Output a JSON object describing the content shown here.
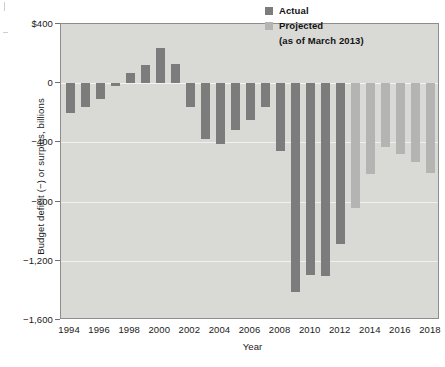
{
  "chart_data": {
    "type": "bar",
    "title": "",
    "subtitle": "",
    "xlabel": "Year",
    "ylabel": "Budget deficit (−) or surplus, billions",
    "xlim": [
      1993.4,
      2018.6
    ],
    "ylim": [
      -1600,
      400
    ],
    "grid": true,
    "legend_position": "top-right",
    "units": "billions of dollars",
    "x": [
      1994,
      1995,
      1996,
      1997,
      1998,
      1999,
      2000,
      2001,
      2002,
      2003,
      2004,
      2005,
      2006,
      2007,
      2008,
      2009,
      2010,
      2011,
      2012,
      2013,
      2014,
      2015,
      2016,
      2017,
      2018
    ],
    "series": [
      {
        "name": "Actual",
        "color": "#7c7c7c",
        "points": [
          {
            "x": 1994,
            "y": -203
          },
          {
            "x": 1995,
            "y": -164
          },
          {
            "x": 1996,
            "y": -107
          },
          {
            "x": 1997,
            "y": -22
          },
          {
            "x": 1998,
            "y": 69
          },
          {
            "x": 1999,
            "y": 126
          },
          {
            "x": 2000,
            "y": 236
          },
          {
            "x": 2001,
            "y": 128
          },
          {
            "x": 2002,
            "y": -158
          },
          {
            "x": 2003,
            "y": -378
          },
          {
            "x": 2004,
            "y": -413
          },
          {
            "x": 2005,
            "y": -318
          },
          {
            "x": 2006,
            "y": -248
          },
          {
            "x": 2007,
            "y": -161
          },
          {
            "x": 2008,
            "y": -459
          },
          {
            "x": 2009,
            "y": -1413
          },
          {
            "x": 2010,
            "y": -1294
          },
          {
            "x": 2011,
            "y": -1300
          },
          {
            "x": 2012,
            "y": -1087
          }
        ]
      },
      {
        "name": "Projected",
        "color": "#b4b4b2",
        "points": [
          {
            "x": 2013,
            "y": -845
          },
          {
            "x": 2014,
            "y": -616
          },
          {
            "x": 2015,
            "y": -430
          },
          {
            "x": 2016,
            "y": -476
          },
          {
            "x": 2017,
            "y": -535
          },
          {
            "x": 2018,
            "y": -605
          }
        ]
      }
    ],
    "yticks": [
      {
        "value": 400,
        "label": "$400"
      },
      {
        "value": 0,
        "label": "0"
      },
      {
        "value": -400,
        "label": "−400"
      },
      {
        "value": -800,
        "label": "−800"
      },
      {
        "value": -1200,
        "label": "−1,200"
      },
      {
        "value": -1600,
        "label": "−1,600"
      }
    ],
    "xticks": [
      {
        "value": 1994,
        "label": "1994"
      },
      {
        "value": 1996,
        "label": "1996"
      },
      {
        "value": 1998,
        "label": "1998"
      },
      {
        "value": 2000,
        "label": "2000"
      },
      {
        "value": 2002,
        "label": "2002"
      },
      {
        "value": 2004,
        "label": "2004"
      },
      {
        "value": 2006,
        "label": "2006"
      },
      {
        "value": 2008,
        "label": "2008"
      },
      {
        "value": 2010,
        "label": "2010"
      },
      {
        "value": 2012,
        "label": "2012"
      },
      {
        "value": 2014,
        "label": "2014"
      },
      {
        "value": 2016,
        "label": "2016"
      },
      {
        "value": 2018,
        "label": "2018"
      }
    ]
  },
  "legend": {
    "actual_label": "Actual",
    "projected_label": "Projected",
    "note": "(as of March 2013)"
  },
  "axes": {
    "x_title": "Year",
    "y_title": "Budget deficit (−) or surplus, billions"
  },
  "colors": {
    "actual": "#7c7c7c",
    "projected": "#b4b4b2",
    "plot_background": "#d9d9d6",
    "gridline": "#f0f0ee",
    "frame": "#8d8d8d"
  }
}
